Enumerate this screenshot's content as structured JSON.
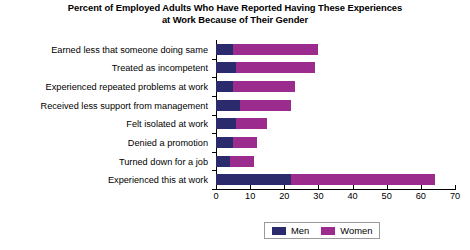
{
  "chart_data": {
    "type": "bar",
    "orientation": "horizontal",
    "stacked": true,
    "title": "Percent of Employed Adults Who Have Reported Having These Experiences at Work Because of Their Gender",
    "title_lines": [
      "Percent of Employed Adults Who Have Reported Having These Experiences",
      "at Work Because of Their Gender"
    ],
    "xlabel": "",
    "ylabel": "",
    "xlim": [
      0,
      70
    ],
    "ylim": null,
    "grid": false,
    "legend_position": "bottom-center",
    "xticks": [
      0,
      10,
      20,
      30,
      40,
      50,
      60,
      70
    ],
    "xtick_labels": [
      "0",
      "10",
      "20",
      "30",
      "40",
      "50",
      "60",
      "70"
    ],
    "categories": [
      "Earned less that someone doing same",
      "Treated as incompetent",
      "Experienced repeated problems at work",
      "Received less support from management",
      "Felt isolated at work",
      "Denied a promotion",
      "Turned down for a job",
      "Experienced this at work"
    ],
    "series": [
      {
        "name": "Men",
        "color": "#2b2a6d",
        "values": [
          5,
          6,
          5,
          7,
          6,
          5,
          4,
          22
        ]
      },
      {
        "name": "Women",
        "color": "#9c2b8e",
        "values": [
          25,
          23,
          18,
          15,
          9,
          7,
          7,
          42
        ]
      }
    ],
    "totals": [
      30,
      29,
      23,
      22,
      15,
      12,
      11,
      64
    ]
  },
  "legend": {
    "items": [
      {
        "label": "Men",
        "color": "#2b2a6d"
      },
      {
        "label": "Women",
        "color": "#9c2b8e"
      }
    ]
  }
}
